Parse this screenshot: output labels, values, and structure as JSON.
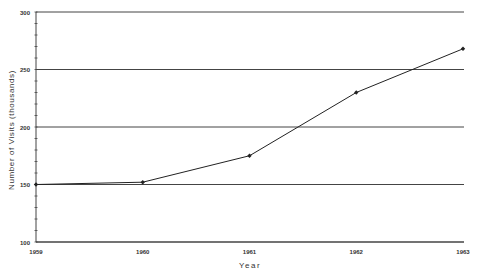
{
  "chart_data": {
    "type": "line",
    "title": "",
    "xlabel": "Year",
    "ylabel": "Number of Visits (thousands)",
    "categories": [
      "1959",
      "1960",
      "1961",
      "1962",
      "1963"
    ],
    "x": [
      1959,
      1960,
      1961,
      1962,
      1963
    ],
    "series": [
      {
        "name": "Visits",
        "values": [
          150,
          152,
          175,
          230,
          268
        ]
      }
    ],
    "ylim": [
      100,
      300
    ],
    "xlim": [
      1959,
      1963
    ],
    "y_ticks": [
      100,
      150,
      200,
      250,
      300
    ],
    "y_tick_labels": [
      "100",
      "150",
      "200",
      "250",
      "300"
    ],
    "y_minor_tick_step": 10,
    "x_tick_labels": [
      "1959",
      "1960",
      "1961",
      "1962",
      "1963"
    ],
    "grid": "horizontal",
    "legend": "none",
    "colors": {
      "line": "#222222",
      "grid": "#444444",
      "text": "#333333"
    }
  }
}
